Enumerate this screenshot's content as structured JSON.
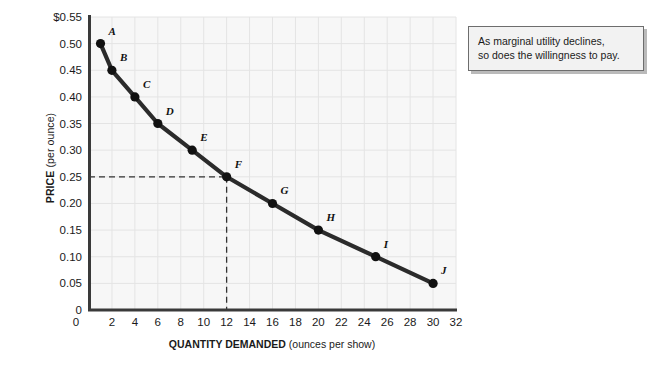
{
  "chart_data": {
    "type": "line",
    "title": "",
    "xlabel_bold": "QUANTITY DEMANDED",
    "xlabel_rest": " (ounces per show)",
    "ylabel_bold": "PRICE",
    "ylabel_rest": " (per ounce)",
    "xlim": [
      0,
      32
    ],
    "ylim": [
      0,
      0.55
    ],
    "grid": true,
    "legend": "none",
    "x_ticks": [
      "0",
      "2",
      "4",
      "6",
      "8",
      "10",
      "12",
      "14",
      "16",
      "18",
      "20",
      "22",
      "24",
      "26",
      "28",
      "30",
      "32"
    ],
    "x_tick_values": [
      0,
      2,
      4,
      6,
      8,
      10,
      12,
      14,
      16,
      18,
      20,
      22,
      24,
      26,
      28,
      30,
      32
    ],
    "y_ticks": [
      "$0.55",
      "0.50",
      "0.45",
      "0.40",
      "0.35",
      "0.30",
      "0.25",
      "0.20",
      "0.15",
      "0.10",
      "0.05",
      "0"
    ],
    "y_tick_values": [
      0.55,
      0.5,
      0.45,
      0.4,
      0.35,
      0.3,
      0.25,
      0.2,
      0.15,
      0.1,
      0.05,
      0
    ],
    "series": [
      {
        "name": "Demand",
        "point_labels": [
          "A",
          "B",
          "C",
          "D",
          "E",
          "F",
          "G",
          "H",
          "I",
          "J"
        ],
        "x": [
          1,
          2,
          4,
          6,
          9,
          12,
          16,
          20,
          25,
          30
        ],
        "values": [
          0.5,
          0.45,
          0.4,
          0.35,
          0.3,
          0.25,
          0.2,
          0.15,
          0.1,
          0.05
        ]
      }
    ],
    "guide_lines": {
      "price": 0.25,
      "quantity": 12,
      "style": "dashed"
    },
    "colors": {
      "curve": "#2b2b2b",
      "point": "#111111",
      "plot_background": "#f7f7f7",
      "grid": "#e4e4e4",
      "axis": "#3a3a3a",
      "annotation_background": "#f2f2f2",
      "annotation_border": "#6d6d6d"
    }
  },
  "annotation": {
    "line1": "As marginal utility declines,",
    "line2": "so does the willingness to pay."
  }
}
